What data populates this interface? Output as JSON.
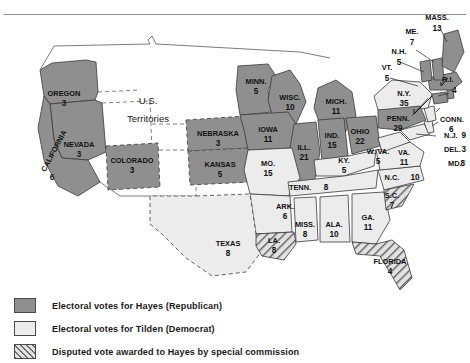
{
  "annotations": {
    "territories": "U.S.",
    "territories2": "Territories"
  },
  "colors": {
    "hayes": "#8f8f8f",
    "tilden": "#ececec",
    "disputed": "#e2e2e2",
    "border": "#3a3a3a",
    "rule": "#8d8d8d"
  },
  "legend": [
    {
      "swatch": "hayes",
      "label": "Electoral votes for Hayes (Republican)"
    },
    {
      "swatch": "tilden",
      "label": "Electoral votes for Tilden (Democrat)"
    },
    {
      "swatch": "disputed",
      "label": "Disputed vote awarded to Hayes by special commission"
    }
  ],
  "states": [
    {
      "name": "OREGON",
      "votes": "3",
      "party": "hayes"
    },
    {
      "name": "NEVADA",
      "votes": "3",
      "party": "hayes"
    },
    {
      "name": "CALIFORNIA",
      "votes": "6",
      "party": "hayes"
    },
    {
      "name": "COLORADO",
      "votes": "3",
      "party": "hayes"
    },
    {
      "name": "NEBRASKA",
      "votes": "3",
      "party": "hayes"
    },
    {
      "name": "KANSAS",
      "votes": "5",
      "party": "hayes"
    },
    {
      "name": "MINN.",
      "votes": "5",
      "party": "hayes"
    },
    {
      "name": "WISC.",
      "votes": "10",
      "party": "hayes"
    },
    {
      "name": "IOWA",
      "votes": "11",
      "party": "hayes"
    },
    {
      "name": "MICH.",
      "votes": "11",
      "party": "hayes"
    },
    {
      "name": "ILL.",
      "votes": "21",
      "party": "hayes"
    },
    {
      "name": "IND.",
      "votes": "15",
      "party": "hayes"
    },
    {
      "name": "OHIO",
      "votes": "22",
      "party": "hayes"
    },
    {
      "name": "MO.",
      "votes": "15",
      "party": "tilden"
    },
    {
      "name": "KY.",
      "votes": "5",
      "party": "tilden"
    },
    {
      "name": "TENN.",
      "votes": "8",
      "party": "tilden"
    },
    {
      "name": "ARK.",
      "votes": "6",
      "party": "tilden"
    },
    {
      "name": "TEXAS",
      "votes": "8",
      "party": "tilden"
    },
    {
      "name": "MISS.",
      "votes": "8",
      "party": "tilden"
    },
    {
      "name": "ALA.",
      "votes": "10",
      "party": "tilden"
    },
    {
      "name": "GA.",
      "votes": "11",
      "party": "tilden"
    },
    {
      "name": "LA.",
      "votes": "8",
      "party": "disputed"
    },
    {
      "name": "S.C.",
      "votes": "7",
      "party": "disputed"
    },
    {
      "name": "FLORIDA",
      "votes": "4",
      "party": "disputed"
    },
    {
      "name": "N.C.",
      "votes": "10",
      "party": "tilden"
    },
    {
      "name": "VA.",
      "votes": "11",
      "party": "tilden"
    },
    {
      "name": "W. VA.",
      "votes": "5",
      "party": "tilden"
    },
    {
      "name": "MD.",
      "votes": "8",
      "party": "tilden"
    },
    {
      "name": "DEL.",
      "votes": "3",
      "party": "tilden"
    },
    {
      "name": "N.J.",
      "votes": "9",
      "party": "tilden"
    },
    {
      "name": "PENN.",
      "votes": "29",
      "party": "hayes"
    },
    {
      "name": "N.Y.",
      "votes": "35",
      "party": "tilden"
    },
    {
      "name": "CONN.",
      "votes": "6",
      "party": "tilden"
    },
    {
      "name": "R.I.",
      "votes": "4",
      "party": "hayes"
    },
    {
      "name": "MASS.",
      "votes": "13",
      "party": "hayes"
    },
    {
      "name": "VT.",
      "votes": "5",
      "party": "hayes"
    },
    {
      "name": "N.H.",
      "votes": "5",
      "party": "hayes"
    },
    {
      "name": "ME.",
      "votes": "7",
      "party": "hayes"
    }
  ]
}
